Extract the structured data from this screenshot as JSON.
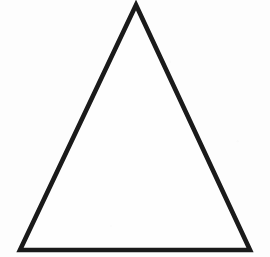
{
  "image": {
    "title": "Triangle outline",
    "width": 270,
    "height": 257,
    "background_color": "#fdfdfd",
    "style": "scanned black-ink line drawing",
    "alt_text": "A tall isosceles triangle drawn as a thick black outline on a white background"
  },
  "chart_data": {
    "type": "diagram",
    "shape": "triangle",
    "classification": "isosceles",
    "title": "",
    "stroke_color": "#1a1a1a",
    "fill_color": "#fefefe",
    "stroke_width": 4.6,
    "vertices": [
      {
        "name": "apex",
        "x": 136,
        "y": 5
      },
      {
        "name": "bottom-right",
        "x": 250,
        "y": 250
      },
      {
        "name": "bottom-left",
        "x": 20,
        "y": 250
      }
    ],
    "edges": [
      {
        "name": "left-side",
        "from": "apex",
        "to": "bottom-left"
      },
      {
        "name": "right-side",
        "from": "apex",
        "to": "bottom-right"
      },
      {
        "name": "base",
        "from": "bottom-left",
        "to": "bottom-right"
      }
    ],
    "base_length_px": 230,
    "height_px": 245,
    "axis_of_symmetry_x": 136,
    "grid": false,
    "legend": false,
    "labels": []
  }
}
